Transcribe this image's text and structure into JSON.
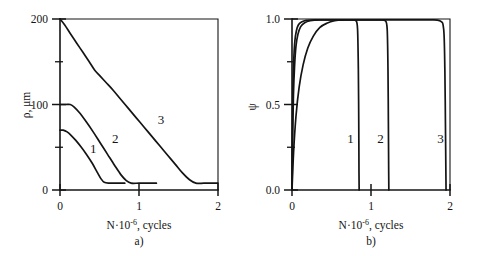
{
  "figure": {
    "panels": [
      {
        "id": "a",
        "caption": "a)",
        "ylabel": "ρ, μm",
        "xlabel_main": "N·10",
        "xlabel_exp": "-6",
        "xlabel_tail": ", cycles",
        "x_ticks": [
          "0",
          "1",
          "2"
        ],
        "y_ticks": [
          "0",
          "100",
          "200"
        ],
        "curve_labels": [
          "1",
          "2",
          "3"
        ]
      },
      {
        "id": "b",
        "caption": "b)",
        "ylabel": "ψ",
        "xlabel_main": "N·10",
        "xlabel_exp": "-6",
        "xlabel_tail": ", cycles",
        "x_ticks": [
          "0",
          "1",
          "2"
        ],
        "y_ticks": [
          "0.0",
          "0.5",
          "1.0"
        ],
        "curve_labels": [
          "1",
          "2",
          "3"
        ]
      }
    ]
  },
  "chart_data": [
    {
      "type": "line",
      "panel": "a",
      "title": "",
      "xlabel": "N·10⁻⁶, cycles",
      "ylabel": "ρ, μm",
      "xlim": [
        0,
        2
      ],
      "ylim": [
        0,
        200
      ],
      "xticks": [
        0,
        1,
        2
      ],
      "yticks": [
        0,
        100,
        200
      ],
      "minor_yticks": [
        50,
        150
      ],
      "grid": false,
      "legend": "inline-curve-labels",
      "series": [
        {
          "name": "1",
          "label_position": [
            0.42,
            48
          ],
          "points": [
            [
              0.0,
              70
            ],
            [
              0.04,
              70
            ],
            [
              0.09,
              68
            ],
            [
              0.14,
              64
            ],
            [
              0.2,
              58
            ],
            [
              0.27,
              50
            ],
            [
              0.34,
              41
            ],
            [
              0.41,
              31
            ],
            [
              0.47,
              21
            ],
            [
              0.52,
              13
            ],
            [
              0.56,
              9
            ],
            [
              0.62,
              8
            ],
            [
              0.72,
              8
            ],
            [
              0.82,
              8
            ]
          ]
        },
        {
          "name": "2",
          "label_position": [
            0.7,
            60
          ],
          "points": [
            [
              0.0,
              100
            ],
            [
              0.07,
              100
            ],
            [
              0.13,
              100
            ],
            [
              0.18,
              97
            ],
            [
              0.25,
              90
            ],
            [
              0.33,
              80
            ],
            [
              0.42,
              68
            ],
            [
              0.51,
              55
            ],
            [
              0.6,
              42
            ],
            [
              0.69,
              29
            ],
            [
              0.77,
              18
            ],
            [
              0.84,
              11
            ],
            [
              0.9,
              8
            ],
            [
              1.0,
              8
            ],
            [
              1.12,
              8
            ],
            [
              1.22,
              8
            ]
          ]
        },
        {
          "name": "3",
          "label_position": [
            1.28,
            82
          ],
          "points": [
            [
              0.0,
              200
            ],
            [
              0.06,
              193
            ],
            [
              0.13,
              183
            ],
            [
              0.21,
              172
            ],
            [
              0.29,
              161
            ],
            [
              0.37,
              150
            ],
            [
              0.44,
              140
            ],
            [
              0.5,
              134
            ],
            [
              0.58,
              126
            ],
            [
              0.67,
              117
            ],
            [
              0.76,
              107
            ],
            [
              0.86,
              96
            ],
            [
              0.96,
              85
            ],
            [
              1.06,
              74
            ],
            [
              1.16,
              63
            ],
            [
              1.26,
              52
            ],
            [
              1.36,
              41
            ],
            [
              1.46,
              30
            ],
            [
              1.55,
              20
            ],
            [
              1.64,
              12
            ],
            [
              1.72,
              8
            ],
            [
              1.82,
              8
            ],
            [
              1.92,
              8
            ],
            [
              2.0,
              8
            ]
          ]
        }
      ]
    },
    {
      "type": "line",
      "panel": "b",
      "title": "",
      "xlabel": "N·10⁻⁶, cycles",
      "ylabel": "ψ",
      "xlim": [
        0,
        2
      ],
      "ylim": [
        0.0,
        1.0
      ],
      "xticks": [
        0,
        1,
        2
      ],
      "yticks": [
        0.0,
        0.5,
        1.0
      ],
      "minor_yticks": [
        0.25,
        0.75
      ],
      "grid": false,
      "legend": "inline-curve-labels",
      "series": [
        {
          "name": "1",
          "label_position": [
            0.74,
            0.3
          ],
          "points": [
            [
              0.0,
              0.0
            ],
            [
              0.02,
              0.22
            ],
            [
              0.05,
              0.43
            ],
            [
              0.09,
              0.6
            ],
            [
              0.14,
              0.73
            ],
            [
              0.2,
              0.83
            ],
            [
              0.27,
              0.9
            ],
            [
              0.35,
              0.95
            ],
            [
              0.44,
              0.975
            ],
            [
              0.54,
              0.99
            ],
            [
              0.65,
              0.995
            ],
            [
              0.76,
              0.995
            ],
            [
              0.81,
              0.99
            ],
            [
              0.83,
              0.94
            ],
            [
              0.84,
              0.7
            ],
            [
              0.845,
              0.4
            ],
            [
              0.848,
              0.1
            ],
            [
              0.85,
              0.0
            ]
          ]
        },
        {
          "name": "2",
          "label_position": [
            1.12,
            0.3
          ],
          "points": [
            [
              0.0,
              0.0
            ],
            [
              0.008,
              0.3
            ],
            [
              0.018,
              0.55
            ],
            [
              0.032,
              0.72
            ],
            [
              0.05,
              0.84
            ],
            [
              0.075,
              0.91
            ],
            [
              0.11,
              0.955
            ],
            [
              0.16,
              0.978
            ],
            [
              0.23,
              0.99
            ],
            [
              0.35,
              0.995
            ],
            [
              0.6,
              0.995
            ],
            [
              0.9,
              0.995
            ],
            [
              1.1,
              0.995
            ],
            [
              1.18,
              0.99
            ],
            [
              1.205,
              0.94
            ],
            [
              1.215,
              0.7
            ],
            [
              1.22,
              0.4
            ],
            [
              1.224,
              0.1
            ],
            [
              1.226,
              0.0
            ]
          ]
        },
        {
          "name": "3",
          "label_position": [
            1.88,
            0.3
          ],
          "points": [
            [
              0.0,
              0.0
            ],
            [
              0.005,
              0.35
            ],
            [
              0.012,
              0.6
            ],
            [
              0.022,
              0.76
            ],
            [
              0.036,
              0.87
            ],
            [
              0.055,
              0.93
            ],
            [
              0.08,
              0.965
            ],
            [
              0.12,
              0.982
            ],
            [
              0.18,
              0.992
            ],
            [
              0.3,
              0.995
            ],
            [
              0.7,
              0.995
            ],
            [
              1.2,
              0.995
            ],
            [
              1.7,
              0.995
            ],
            [
              1.87,
              0.99
            ],
            [
              1.92,
              0.94
            ],
            [
              1.935,
              0.7
            ],
            [
              1.942,
              0.4
            ],
            [
              1.948,
              0.1
            ],
            [
              1.95,
              0.0
            ]
          ]
        }
      ]
    }
  ]
}
